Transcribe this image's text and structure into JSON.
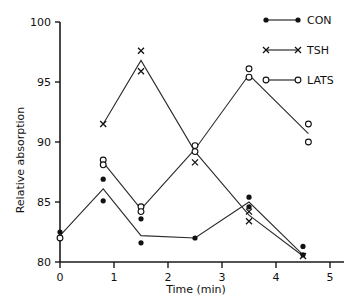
{
  "chart_data": {
    "type": "line",
    "title": "",
    "xlabel": "Time  (min)",
    "ylabel": "Relative absorption",
    "xlim": [
      0,
      5
    ],
    "ylim": [
      80,
      100
    ],
    "xticks": [
      "0",
      "1",
      "2",
      "3",
      "4",
      "5"
    ],
    "xtick_values": [
      0,
      1,
      2,
      3,
      4,
      5
    ],
    "yticks": [
      "80",
      "85",
      "90",
      "95",
      "100"
    ],
    "ytick_values": [
      80,
      85,
      90,
      95,
      100
    ],
    "grid": false,
    "legend_position": "top-right",
    "series": [
      {
        "name": "CON",
        "marker": "filled-circle",
        "x": [
          0.0,
          0.8,
          1.5,
          2.5,
          3.5,
          4.5
        ],
        "values": [
          82.2,
          86.1,
          82.2,
          82.0,
          85.0,
          80.6
        ]
      },
      {
        "name": "TSH",
        "marker": "cross",
        "x": [
          0.8,
          1.5,
          2.5,
          3.5,
          4.5
        ],
        "values": [
          91.5,
          96.8,
          89.2,
          83.9,
          80.5
        ]
      },
      {
        "name": "LATS",
        "marker": "open-circle",
        "x": [
          0.8,
          1.5,
          2.5,
          3.5,
          4.6
        ],
        "values": [
          88.3,
          84.4,
          89.4,
          95.6,
          90.7
        ]
      }
    ],
    "replicate_points": {
      "note": "individual replicate markers plotted around each mean",
      "CON": [
        {
          "x": 0.0,
          "y": 82.5
        },
        {
          "x": 0.0,
          "y": 82.0
        },
        {
          "x": 0.8,
          "y": 86.9
        },
        {
          "x": 0.8,
          "y": 85.1
        },
        {
          "x": 1.5,
          "y": 83.6
        },
        {
          "x": 1.5,
          "y": 81.6
        },
        {
          "x": 2.5,
          "y": 82.0
        },
        {
          "x": 3.5,
          "y": 85.4
        },
        {
          "x": 3.5,
          "y": 84.6
        },
        {
          "x": 4.5,
          "y": 81.3
        },
        {
          "x": 4.5,
          "y": 80.6
        }
      ],
      "TSH": [
        {
          "x": 0.8,
          "y": 91.5
        },
        {
          "x": 1.5,
          "y": 97.6
        },
        {
          "x": 1.5,
          "y": 95.9
        },
        {
          "x": 2.5,
          "y": 88.3
        },
        {
          "x": 3.5,
          "y": 84.2
        },
        {
          "x": 3.5,
          "y": 83.4
        },
        {
          "x": 4.5,
          "y": 80.5
        }
      ],
      "LATS": [
        {
          "x": 0.0,
          "y": 82.0
        },
        {
          "x": 0.8,
          "y": 88.5
        },
        {
          "x": 0.8,
          "y": 88.1
        },
        {
          "x": 1.5,
          "y": 84.6
        },
        {
          "x": 1.5,
          "y": 84.2
        },
        {
          "x": 2.5,
          "y": 89.7
        },
        {
          "x": 2.5,
          "y": 89.2
        },
        {
          "x": 3.5,
          "y": 96.1
        },
        {
          "x": 3.5,
          "y": 95.4
        },
        {
          "x": 4.6,
          "y": 91.5
        },
        {
          "x": 4.6,
          "y": 90.0
        }
      ]
    }
  },
  "legend": {
    "items": [
      {
        "label": "CON",
        "marker": "filled-circle"
      },
      {
        "label": "TSH",
        "marker": "cross"
      },
      {
        "label": "LATS",
        "marker": "open-circle"
      }
    ]
  },
  "colors": {
    "ink": "#111111",
    "line": "#2b2b2b",
    "background": "#ffffff"
  }
}
